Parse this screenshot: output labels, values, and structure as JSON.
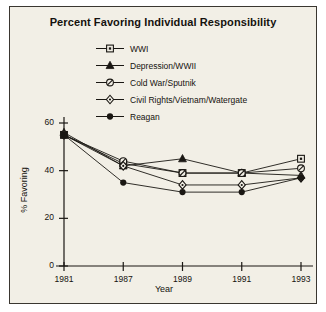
{
  "chart_data": {
    "type": "line",
    "title": "Percent Favoring Individual Responsibility",
    "xlabel": "Year",
    "ylabel": "% Favoring",
    "categories": [
      "1981",
      "1987",
      "1989",
      "1991",
      "1993"
    ],
    "x": [
      1981,
      1987,
      1989,
      1991,
      1993
    ],
    "ylim": [
      0,
      60
    ],
    "yticks": [
      0,
      20,
      40,
      60
    ],
    "grid": false,
    "legend_position": "top-center",
    "series": [
      {
        "name": "WWI",
        "marker": "open-square",
        "values": [
          55,
          43,
          39,
          39,
          45
        ]
      },
      {
        "name": "Depression/WWII",
        "marker": "filled-triangle",
        "values": [
          56,
          42,
          45,
          39,
          38
        ]
      },
      {
        "name": "Cold War/Sputnik",
        "marker": "slashed-circle",
        "values": [
          55,
          44,
          39,
          39,
          41
        ]
      },
      {
        "name": "Civil Rights/Vietnam/Watergate",
        "marker": "open-diamond",
        "values": [
          55,
          42,
          34,
          34,
          37
        ]
      },
      {
        "name": "Reagan",
        "marker": "filled-circle",
        "values": [
          55,
          35,
          31,
          31,
          37
        ]
      }
    ]
  },
  "legend": {
    "items": [
      {
        "label": "WWI",
        "marker": "open-square"
      },
      {
        "label": "Depression/WWII",
        "marker": "filled-triangle"
      },
      {
        "label": "Cold War/Sputnik",
        "marker": "slashed-circle"
      },
      {
        "label": "Civil Rights/Vietnam/Watergate",
        "marker": "open-diamond"
      },
      {
        "label": "Reagan",
        "marker": "filled-circle"
      }
    ]
  },
  "style": {
    "ink": "#1a1713",
    "panel_background": "#f2efe6",
    "border": "#3a3630"
  }
}
